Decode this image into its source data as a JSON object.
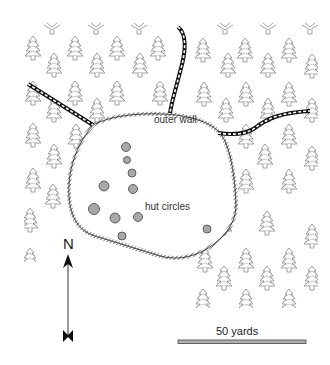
{
  "map": {
    "labels": {
      "outer_wall": "outer wall",
      "hut_circles": "hut circles"
    },
    "north_arrow": {
      "letter": "N"
    },
    "scale_bar": {
      "label": "50 yards"
    },
    "colors": {
      "tree": "#8a8a8a",
      "wall": "#222222",
      "hut_fill": "#a8a8a8",
      "hut_stroke": "#555555",
      "track": "#111111",
      "scale_bar": "#b0b0b0"
    },
    "hut_circles": [
      {
        "x": 126,
        "y": 147,
        "r": 4.5
      },
      {
        "x": 127,
        "y": 160,
        "r": 3.5
      },
      {
        "x": 132,
        "y": 173,
        "r": 4
      },
      {
        "x": 104,
        "y": 186,
        "r": 5
      },
      {
        "x": 133,
        "y": 189,
        "r": 4.5
      },
      {
        "x": 94,
        "y": 209,
        "r": 5.5
      },
      {
        "x": 115,
        "y": 218,
        "r": 5
      },
      {
        "x": 138,
        "y": 217,
        "r": 4.5
      },
      {
        "x": 122,
        "y": 236,
        "r": 4
      },
      {
        "x": 207,
        "y": 229,
        "r": 4
      }
    ]
  }
}
